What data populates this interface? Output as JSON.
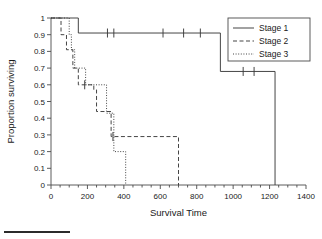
{
  "figure": {
    "background_color": "#ffffff",
    "line_color": "#3b3b3b",
    "axis_color": "#4a4a4a",
    "text_color": "#1a1a1a"
  },
  "axes": {
    "x_title": "Survival Time",
    "y_title": "Proportion surviving",
    "x_ticks": [
      "0",
      "200",
      "400",
      "600",
      "800",
      "1000",
      "1200",
      "1400"
    ],
    "y_ticks": [
      "1",
      "0.9",
      "0.8",
      "0.7",
      "0.6",
      "0.5",
      "0.4",
      "0.3",
      "0.2",
      "0.1",
      "0"
    ]
  },
  "legend": {
    "position": "top-right",
    "items": [
      {
        "label": "Stage 1",
        "style": "solid"
      },
      {
        "label": "Stage 2",
        "style": "dashed"
      },
      {
        "label": "Stage 3",
        "style": "dotted"
      }
    ]
  },
  "chart_data": {
    "type": "line",
    "subtype": "kaplan-meier-step",
    "title": "",
    "xlabel": "Survival Time",
    "ylabel": "Proportion surviving",
    "xlim": [
      0,
      1400
    ],
    "ylim": [
      0,
      1
    ],
    "x_major_tick_step": 200,
    "x_minor_tick_step": 50,
    "y_tick_step": 0.1,
    "grid": false,
    "legend_position": "top-right",
    "series": [
      {
        "name": "Stage 1",
        "style": "solid",
        "steps": [
          {
            "x": 0,
            "y": 1
          },
          {
            "x": 150,
            "y": 1
          },
          {
            "x": 150,
            "y": 0.91
          },
          {
            "x": 930,
            "y": 0.91
          },
          {
            "x": 930,
            "y": 0.68
          },
          {
            "x": 1230,
            "y": 0.68
          },
          {
            "x": 1230,
            "y": 0
          }
        ],
        "censored": [
          {
            "x": 310,
            "y": 0.91
          },
          {
            "x": 345,
            "y": 0.91
          },
          {
            "x": 615,
            "y": 0.91
          },
          {
            "x": 728,
            "y": 0.91
          },
          {
            "x": 820,
            "y": 0.91
          },
          {
            "x": 1055,
            "y": 0.68
          },
          {
            "x": 1115,
            "y": 0.68
          }
        ]
      },
      {
        "name": "Stage 2",
        "style": "dashed",
        "steps": [
          {
            "x": 0,
            "y": 1
          },
          {
            "x": 55,
            "y": 1
          },
          {
            "x": 55,
            "y": 0.9
          },
          {
            "x": 85,
            "y": 0.9
          },
          {
            "x": 85,
            "y": 0.81
          },
          {
            "x": 120,
            "y": 0.81
          },
          {
            "x": 120,
            "y": 0.7
          },
          {
            "x": 150,
            "y": 0.7
          },
          {
            "x": 150,
            "y": 0.6
          },
          {
            "x": 235,
            "y": 0.6
          },
          {
            "x": 235,
            "y": 0.57
          },
          {
            "x": 250,
            "y": 0.57
          },
          {
            "x": 250,
            "y": 0.44
          },
          {
            "x": 330,
            "y": 0.44
          },
          {
            "x": 330,
            "y": 0.29
          },
          {
            "x": 700,
            "y": 0.29
          },
          {
            "x": 700,
            "y": 0
          }
        ],
        "censored": [
          {
            "x": 185,
            "y": 0.6
          },
          {
            "x": 340,
            "y": 0.29
          }
        ]
      },
      {
        "name": "Stage 3",
        "style": "dotted",
        "steps": [
          {
            "x": 0,
            "y": 1
          },
          {
            "x": 100,
            "y": 1
          },
          {
            "x": 100,
            "y": 0.9
          },
          {
            "x": 112,
            "y": 0.9
          },
          {
            "x": 112,
            "y": 0.81
          },
          {
            "x": 130,
            "y": 0.81
          },
          {
            "x": 130,
            "y": 0.7
          },
          {
            "x": 190,
            "y": 0.7
          },
          {
            "x": 190,
            "y": 0.6
          },
          {
            "x": 305,
            "y": 0.6
          },
          {
            "x": 305,
            "y": 0.43
          },
          {
            "x": 345,
            "y": 0.43
          },
          {
            "x": 345,
            "y": 0.2
          },
          {
            "x": 410,
            "y": 0.2
          },
          {
            "x": 410,
            "y": 0
          }
        ],
        "censored": []
      }
    ]
  }
}
